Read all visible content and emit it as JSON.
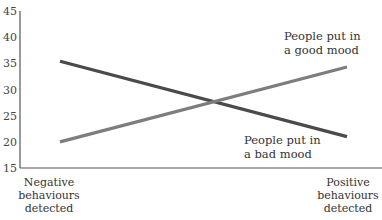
{
  "chart_data": {
    "type": "line",
    "title": "",
    "xlabel": "",
    "ylabel": "",
    "ylim": [
      15,
      45
    ],
    "yticks": [
      15,
      20,
      25,
      30,
      35,
      40,
      45
    ],
    "categories": [
      [
        "Negative",
        "behaviours",
        "detected"
      ],
      [
        "Positive",
        "behaviours",
        "detected"
      ]
    ],
    "grid": false,
    "series": [
      {
        "name": "People put in a bad mood",
        "label_lines": [
          "People put in",
          "a bad mood"
        ],
        "color": "#4a4a4a",
        "values": [
          35.4,
          21
        ]
      },
      {
        "name": "People put in a good mood",
        "label_lines": [
          "People put in",
          "a good mood"
        ],
        "color": "#7d7d7d",
        "values": [
          20,
          34.3
        ]
      }
    ]
  }
}
